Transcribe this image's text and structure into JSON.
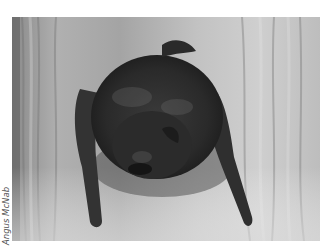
{
  "photo": {
    "subject": "bat clinging to tree bark",
    "palette": {
      "bark_light": "#c9c9c9",
      "bark_mid": "#9d9d9d",
      "bark_dark": "#6a6a6a",
      "fur": "#2e2e2e",
      "fur_dark": "#1a1a1a",
      "wing": "#3a3a3a"
    }
  },
  "credit": {
    "text": "Angus McNab"
  }
}
